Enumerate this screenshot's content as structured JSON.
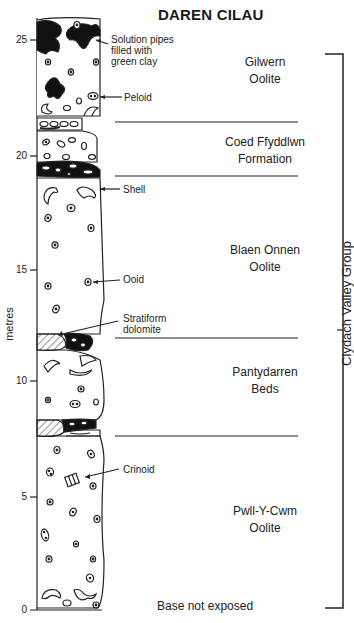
{
  "title": "DAREN CILAU",
  "y_axis": {
    "label": "metres",
    "ticks": [
      {
        "value": "25",
        "y": 40
      },
      {
        "value": "20",
        "y": 156
      },
      {
        "value": "15",
        "y": 270
      },
      {
        "value": "10",
        "y": 381
      },
      {
        "value": "5",
        "y": 497
      },
      {
        "value": "0",
        "y": 610
      }
    ]
  },
  "units": [
    {
      "name_line1": "Gilwern",
      "name_line2": "Oolite"
    },
    {
      "name_line1": "Coed Ffyddlwn",
      "name_line2": "Formation"
    },
    {
      "name_line1": "Blaen Onnen",
      "name_line2": "Oolite"
    },
    {
      "name_line1": "Pantydarren",
      "name_line2": "Beds"
    },
    {
      "name_line1": "Pwll-Y-Cwm",
      "name_line2": "Oolite"
    }
  ],
  "annotations": {
    "solution_pipes": [
      "Solution pipes",
      "filled with",
      "green clay"
    ],
    "peloid": "Peloid",
    "shell": "Shell",
    "ooid": "Ooid",
    "stratiform_dolomite": [
      "Stratiform",
      "dolomite"
    ],
    "crinoid": "Crinoid"
  },
  "group": "Clydach Valley Group",
  "base_note": "Base not exposed"
}
